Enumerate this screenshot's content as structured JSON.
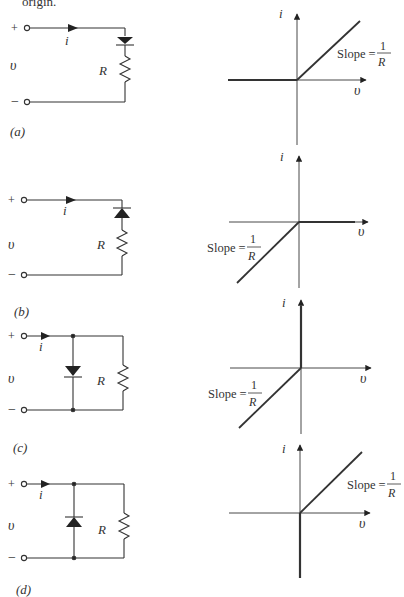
{
  "header_fragment": "origin.",
  "panels": [
    {
      "id": "a",
      "label": "(a)",
      "circuit": {
        "plus": "+",
        "minus": "−",
        "voltage": "υ",
        "current": "i",
        "resistor": "R",
        "topology": "series",
        "diode_direction": "down (forward in direction of i)"
      },
      "graph": {
        "y_axis_label": "i",
        "x_axis_label": "υ",
        "slope_text": "Slope =",
        "slope_num": "1",
        "slope_den": "R",
        "description": "i = 0 for v < 0; i = v/R for v > 0"
      }
    },
    {
      "id": "b",
      "label": "(b)",
      "circuit": {
        "plus": "+",
        "minus": "−",
        "voltage": "υ",
        "current": "i",
        "resistor": "R",
        "topology": "series",
        "diode_direction": "up (reverse)"
      },
      "graph": {
        "y_axis_label": "i",
        "x_axis_label": "υ",
        "slope_text": "Slope =",
        "slope_num": "1",
        "slope_den": "R",
        "description": "i = v/R for v < 0; i = 0 for v > 0"
      }
    },
    {
      "id": "c",
      "label": "(c)",
      "circuit": {
        "plus": "+",
        "minus": "−",
        "voltage": "υ",
        "current": "i",
        "resistor": "R",
        "topology": "parallel",
        "diode_direction": "down (forward)"
      },
      "graph": {
        "y_axis_label": "i",
        "x_axis_label": "υ",
        "slope_text": "Slope =",
        "slope_num": "1",
        "slope_den": "R",
        "description": "i = v/R for v < 0; vertical (short) at v = 0 for i > 0"
      }
    },
    {
      "id": "d",
      "label": "(d)",
      "circuit": {
        "plus": "+",
        "minus": "−",
        "voltage": "υ",
        "current": "i",
        "resistor": "R",
        "topology": "parallel",
        "diode_direction": "up (reverse)"
      },
      "graph": {
        "y_axis_label": "i",
        "x_axis_label": "υ",
        "slope_text": "Slope =",
        "slope_num": "1",
        "slope_den": "R",
        "description": "i = v/R for v > 0; vertical at v = 0 for i < 0"
      }
    }
  ]
}
